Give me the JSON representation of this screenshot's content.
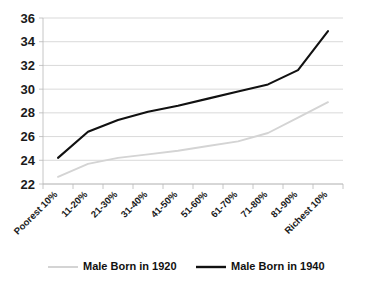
{
  "chart_data": {
    "type": "line",
    "title": "",
    "subtitle": "",
    "xlabel": "",
    "ylabel": "",
    "ylim": [
      22,
      36
    ],
    "yticks": [
      22,
      24,
      26,
      28,
      30,
      32,
      34,
      36
    ],
    "grid": true,
    "legend_position": "bottom",
    "categories": [
      "Poorest 10%",
      "11-20%",
      "21-30%",
      "31-40%",
      "41-50%",
      "51-60%",
      "61-70%",
      "71-80%",
      "81-90%",
      "Richest 10%"
    ],
    "series": [
      {
        "name": "Male Born in 1920",
        "color": "#d4d4d4",
        "values": [
          22.6,
          23.7,
          24.2,
          24.5,
          24.8,
          25.2,
          25.6,
          26.3,
          27.6,
          28.9
        ]
      },
      {
        "name": "Male Born in 1940",
        "color": "#111111",
        "values": [
          24.2,
          26.4,
          27.4,
          28.1,
          28.6,
          29.2,
          29.8,
          30.4,
          31.6,
          34.9
        ]
      }
    ]
  },
  "legend": {
    "entries": [
      {
        "label": "Male Born in 1920",
        "color": "#d4d4d4"
      },
      {
        "label": "Male Born in 1940",
        "color": "#111111"
      }
    ]
  },
  "colors": {
    "grid": "#c9c9c9",
    "axis": "#b8b8b8",
    "text": "#1a1a1a",
    "background": "#ffffff"
  }
}
